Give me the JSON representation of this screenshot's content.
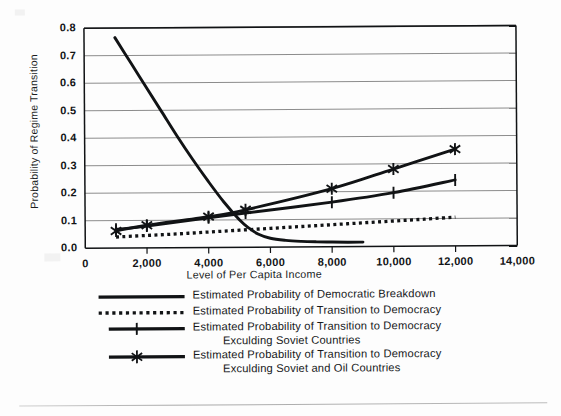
{
  "figure": {
    "background_color": "#fdfdfd",
    "line_color": "#111315",
    "grid_color": "#8c8c8c",
    "axis_color": "#111315"
  },
  "axes": {
    "y_title": "Probability of Regime Transition",
    "x_title": "Level of Per Capita Income",
    "y_ticks": [
      "0.0",
      "0.1",
      "0.2",
      "0.3",
      "0.4",
      "0.5",
      "0.6",
      "0.7",
      "0.8"
    ],
    "x_ticks": [
      "0",
      "2,000",
      "4,000",
      "6,000",
      "8,000",
      "10,000",
      "12,000",
      "14,000"
    ]
  },
  "legend": {
    "items": [
      {
        "key": "solid-line-key",
        "name": "legend-democratic-breakdown",
        "line1": "Estimated Probability of Democratic Breakdown",
        "line2": ""
      },
      {
        "key": "dotted-line-key",
        "name": "legend-transition-to-democracy",
        "line1": "Estimated Probability of Transition to Democracy",
        "line2": ""
      },
      {
        "key": "plus-marker-key",
        "name": "legend-transition-excl-soviet",
        "line1": "Estimated Probability of Transition to Democracy",
        "line2": "Exculding Soviet Countries"
      },
      {
        "key": "star-marker-key",
        "name": "legend-transition-excl-soviet-oil",
        "line1": "Estimated Probability of Transition to Democracy",
        "line2": "Exculding Soviet and Oil Countries"
      }
    ]
  },
  "chart_data": {
    "type": "line",
    "title": "",
    "xlabel": "Level of Per Capita Income",
    "ylabel": "Probability of Regime Transition",
    "xlim": [
      0,
      14000
    ],
    "ylim": [
      0.0,
      0.8
    ],
    "xticks": [
      0,
      2000,
      4000,
      6000,
      8000,
      10000,
      12000,
      14000
    ],
    "yticks": [
      0.0,
      0.1,
      0.2,
      0.3,
      0.4,
      0.5,
      0.6,
      0.7,
      0.8
    ],
    "grid": "horizontal",
    "legend_position": "below",
    "series": [
      {
        "name": "Estimated Probability of Democratic Breakdown",
        "style": "solid",
        "marker": "none",
        "x": [
          1000,
          1500,
          2000,
          2500,
          3000,
          3500,
          4000,
          4500,
          5000,
          5300,
          5600,
          6000,
          6500,
          7000,
          7500,
          8000,
          8500,
          9000
        ],
        "y": [
          0.765,
          0.675,
          0.585,
          0.495,
          0.405,
          0.32,
          0.24,
          0.165,
          0.1,
          0.07,
          0.048,
          0.032,
          0.024,
          0.02,
          0.018,
          0.017,
          0.016,
          0.016
        ]
      },
      {
        "name": "Estimated Probability of Transition to Democracy",
        "style": "dotted",
        "marker": "none",
        "x": [
          1000,
          2000,
          3000,
          4000,
          5000,
          6000,
          7000,
          8000,
          9000,
          10000,
          11000,
          12000
        ],
        "y": [
          0.04,
          0.045,
          0.05,
          0.056,
          0.062,
          0.068,
          0.074,
          0.08,
          0.086,
          0.092,
          0.098,
          0.105
        ]
      },
      {
        "name": "Estimated Probability of Transition to Democracy Exculding Soviet Countries",
        "style": "solid",
        "marker": "plus",
        "x": [
          1000,
          2000,
          4000,
          5200,
          8000,
          10000,
          12000
        ],
        "y": [
          0.068,
          0.079,
          0.108,
          0.124,
          0.162,
          0.195,
          0.24
        ]
      },
      {
        "name": "Estimated Probability of Transition to Democracy Exculding Soviet and Oil Countries",
        "style": "solid",
        "marker": "star",
        "x": [
          1000,
          2000,
          4000,
          5200,
          8000,
          10000,
          12000
        ],
        "y": [
          0.062,
          0.082,
          0.112,
          0.136,
          0.211,
          0.281,
          0.352
        ]
      }
    ]
  }
}
